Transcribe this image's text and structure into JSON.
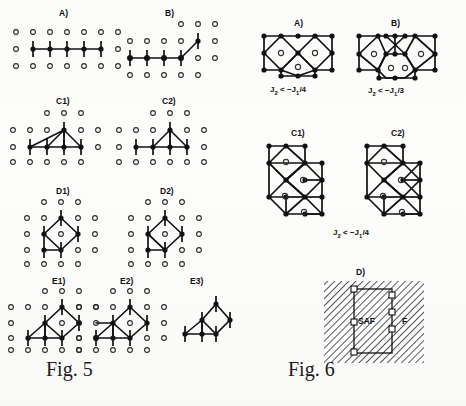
{
  "document": {
    "type": "scanned-figure-page",
    "background_color": "#fdfdfb",
    "ink_color": "#111111"
  },
  "figures": [
    {
      "id": "fig5",
      "caption": "Fig. 5",
      "caption_number": "5",
      "caption_prefix": "Fig.",
      "description": "Spin cluster configurations on a square lattice",
      "panels": [
        {
          "id": "A",
          "label": "A)"
        },
        {
          "id": "B",
          "label": "B)"
        },
        {
          "id": "C1",
          "label": "C1)"
        },
        {
          "id": "C2",
          "label": "C2)"
        },
        {
          "id": "D1",
          "label": "D1)"
        },
        {
          "id": "D2",
          "label": "D2)"
        },
        {
          "id": "E1",
          "label": "E1)"
        },
        {
          "id": "E2",
          "label": "E2)"
        },
        {
          "id": "E3",
          "label": "E3)"
        }
      ]
    },
    {
      "id": "fig6",
      "caption": "Fig. 6",
      "caption_number": "6",
      "caption_prefix": "Fig.",
      "description": "Polygon cluster diagrams and phase diagram",
      "panels": [
        {
          "id": "A",
          "label": "A)",
          "formula": {
            "lhs": "J",
            "lhs_sub": "2",
            "relation": " < −",
            "rhs": "J",
            "rhs_sub": "1",
            "denom": "/4",
            "full": "J2 < -J1/4"
          }
        },
        {
          "id": "B",
          "label": "B)",
          "formula": {
            "lhs": "J",
            "lhs_sub": "2",
            "relation": " < −",
            "rhs": "J",
            "rhs_sub": "1",
            "denom": "/3",
            "full": "J2 < -J1/3"
          }
        },
        {
          "id": "C1",
          "label": "C1)",
          "formula": null
        },
        {
          "id": "C2",
          "label": "C2)",
          "formula": null
        },
        {
          "id": "C_shared",
          "label": "",
          "formula": {
            "lhs": "J",
            "lhs_sub": "2",
            "relation": " < −",
            "rhs": "J",
            "rhs_sub": "1",
            "denom": "/4",
            "full": "J2 < -J1/4"
          }
        },
        {
          "id": "D",
          "label": "D)",
          "formula": null
        }
      ],
      "phase_diagram": {
        "region_left_label": "SAF",
        "region_right_label": "F"
      }
    }
  ]
}
